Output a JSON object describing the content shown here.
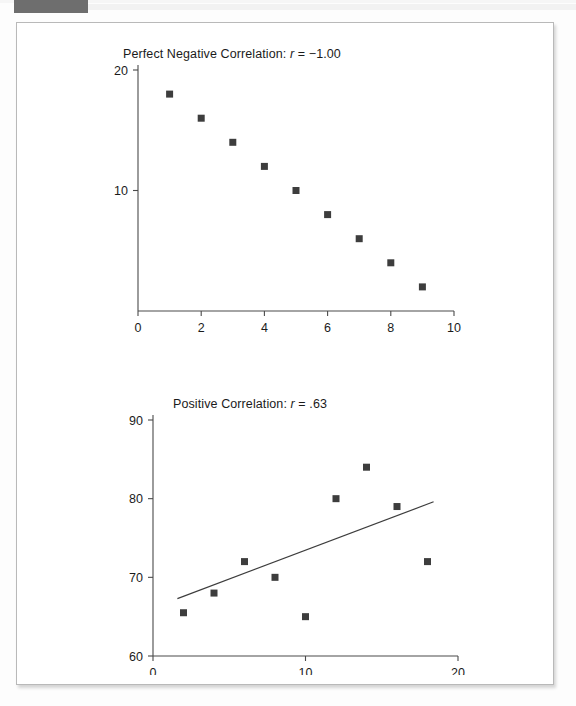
{
  "page": {
    "background_color": "#fdfdfd",
    "frame_border_color": "#b9b9b9",
    "corner_tab_color": "#6e6e6e"
  },
  "marker_color": "#3d3d3d",
  "axis_color": "#4a4a4a",
  "chart_data": [
    {
      "type": "scatter",
      "title_prefix": "Perfect Negative Correlation: ",
      "title_r": "r",
      "title_value": " = −1.00",
      "title": "Perfect Negative Correlation: r = −1.00",
      "xlabel": "",
      "ylabel": "",
      "xlim": [
        0,
        10
      ],
      "ylim": [
        0,
        20
      ],
      "xticks": [
        0,
        2,
        4,
        6,
        8,
        10
      ],
      "xtick_labels": [
        "0",
        "2",
        "4",
        "6",
        "8",
        "10"
      ],
      "yticks": [
        10,
        20
      ],
      "ytick_labels": [
        "10",
        "20"
      ],
      "grid": false,
      "legend": "none",
      "x": [
        1,
        2,
        3,
        4,
        5,
        6,
        7,
        8,
        9
      ],
      "y": [
        18,
        16,
        14,
        12,
        10,
        8,
        6,
        4,
        2
      ],
      "points": [
        {
          "x": 1,
          "y": 18
        },
        {
          "x": 2,
          "y": 16
        },
        {
          "x": 3,
          "y": 14
        },
        {
          "x": 4,
          "y": 12
        },
        {
          "x": 5,
          "y": 10
        },
        {
          "x": 6,
          "y": 8
        },
        {
          "x": 7,
          "y": 6
        },
        {
          "x": 8,
          "y": 4
        },
        {
          "x": 9,
          "y": 2
        }
      ],
      "trendline": null
    },
    {
      "type": "scatter",
      "title_prefix": "Positive Correlation: ",
      "title_r": "r",
      "title_value": " = .63",
      "title": "Positive Correlation: r = .63",
      "xlabel": "",
      "ylabel": "",
      "xlim": [
        0,
        20
      ],
      "ylim": [
        60,
        90
      ],
      "xticks": [
        0,
        10,
        20
      ],
      "xtick_labels": [
        "0",
        "10",
        "20"
      ],
      "yticks": [
        60,
        70,
        80,
        90
      ],
      "ytick_labels": [
        "60",
        "70",
        "80",
        "90"
      ],
      "grid": false,
      "legend": "none",
      "x": [
        2,
        4,
        6,
        8,
        10,
        12,
        14,
        16,
        18
      ],
      "y": [
        65.5,
        68,
        72,
        70,
        65,
        80,
        84,
        79,
        72
      ],
      "points": [
        {
          "x": 2,
          "y": 65.5
        },
        {
          "x": 4,
          "y": 68
        },
        {
          "x": 6,
          "y": 72
        },
        {
          "x": 8,
          "y": 70
        },
        {
          "x": 10,
          "y": 65
        },
        {
          "x": 12,
          "y": 80
        },
        {
          "x": 14,
          "y": 84
        },
        {
          "x": 16,
          "y": 79
        },
        {
          "x": 18,
          "y": 72
        }
      ],
      "trendline": {
        "x1": 1.6,
        "y1": 67.3,
        "x2": 18.4,
        "y2": 79.6
      }
    }
  ]
}
